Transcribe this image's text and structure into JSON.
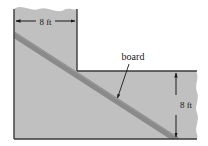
{
  "figure": {
    "background_color": "#ffffff",
    "region_fill_color": "#c0c0c0",
    "region_edge_color": "#3a3a3a",
    "board_color": "#8a8a8a",
    "annotation_color": "#1a1a1a"
  },
  "labels": {
    "top_dimension": "8 ft",
    "right_dimension": "8 ft",
    "callout": "board"
  },
  "geometry": {
    "step_corner_x": 77,
    "step_corner_y": 71,
    "region_left_x": 14,
    "region_bottom_y": 139,
    "region_right_x": 198,
    "board_start": [
      14,
      35
    ],
    "board_end": [
      176,
      139
    ],
    "top_dimension_y": 21,
    "top_dimension_x1": 14,
    "top_dimension_x2": 77,
    "right_dimension_x": 176,
    "right_dimension_y1": 71,
    "right_dimension_y2": 139,
    "callout_anchor": [
      120,
      57
    ],
    "callout_target": [
      117,
      99
    ]
  }
}
